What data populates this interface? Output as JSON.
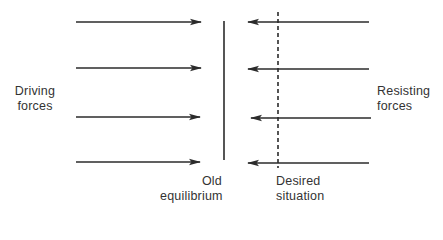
{
  "diagram": {
    "type": "force-field-analysis",
    "labels": {
      "driving": [
        "Driving",
        "forces"
      ],
      "resisting": [
        "Resisting",
        "forces"
      ],
      "old_equilibrium": [
        "Old",
        "equilibrium"
      ],
      "desired_situation": [
        "Desired",
        "situation"
      ]
    },
    "driving_forces": {
      "direction": "right",
      "count": 4,
      "arrows": [
        {
          "x1": 76,
          "x2": 201,
          "y": 22
        },
        {
          "x1": 76,
          "x2": 201,
          "y": 68
        },
        {
          "x1": 76,
          "x2": 200,
          "y": 117
        },
        {
          "x1": 76,
          "x2": 200,
          "y": 162
        }
      ]
    },
    "resisting_forces": {
      "direction": "left",
      "count": 4,
      "arrows": [
        {
          "x1": 369,
          "x2": 248,
          "y": 22
        },
        {
          "x1": 369,
          "x2": 248,
          "y": 69
        },
        {
          "x1": 371,
          "x2": 251,
          "y": 118
        },
        {
          "x1": 369,
          "x2": 248,
          "y": 163
        }
      ]
    },
    "old_equilibrium_line": {
      "x": 224,
      "y1": 21,
      "y2": 160,
      "style": "solid"
    },
    "desired_situation_line": {
      "x": 278,
      "y1": 12,
      "y2": 168,
      "style": "dashed"
    },
    "colors": {
      "line": "#2b2b2b",
      "text": "#333333",
      "background": "#ffffff"
    }
  }
}
